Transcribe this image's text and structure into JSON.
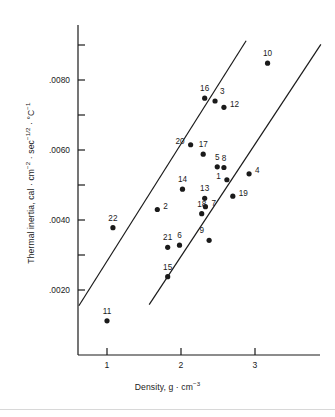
{
  "figure": {
    "kind": "scatter-plot",
    "background": "#ffffff",
    "ink_color": "#1a1a1a"
  },
  "chart_data": {
    "type": "scatter",
    "title": "",
    "xlabel": "Density, g · cm⁻³",
    "ylabel": "Thermal inertia, cal · cm⁻² · sec⁻¹ᐟ² · °C⁻¹",
    "xlabel_parts": {
      "lead": "Density, g · cm",
      "exp": "−3"
    },
    "ylabel_parts": {
      "lead": "Thermal inertia, cal · cm",
      "exp1": "−2",
      "mid1": " · sec",
      "exp2": "−1/2",
      "mid2": " · °C",
      "exp3": "−1"
    },
    "xlim": [
      0.55,
      3.48
    ],
    "ylim": [
      0.0009,
      0.00935
    ],
    "xticks": [
      1,
      2,
      3
    ],
    "xtick_labels": [
      "1",
      "2",
      "3"
    ],
    "yticks": [
      0.002,
      0.003,
      0.004,
      0.005,
      0.006,
      0.007,
      0.008,
      0.009
    ],
    "ytick_labels": [
      ".0020",
      "",
      ".0040",
      "",
      ".0060",
      "",
      ".0080",
      ""
    ],
    "ytick_labeled": [
      0.002,
      0.004,
      0.006,
      0.008
    ],
    "grid": false,
    "legend": null,
    "points": [
      {
        "label": "1",
        "x": 2.62,
        "y": 0.00515,
        "label_pos": "left"
      },
      {
        "label": "2",
        "x": 1.68,
        "y": 0.0043,
        "label_pos": "right"
      },
      {
        "label": "3",
        "x": 2.46,
        "y": 0.0074,
        "label_pos": "above-right"
      },
      {
        "label": "4",
        "x": 2.92,
        "y": 0.00532,
        "label_pos": "right"
      },
      {
        "label": "5",
        "x": 2.49,
        "y": 0.00552,
        "label_pos": "above"
      },
      {
        "label": "6",
        "x": 1.98,
        "y": 0.00328,
        "label_pos": "above"
      },
      {
        "label": "7",
        "x": 2.33,
        "y": 0.00438,
        "label_pos": "right"
      },
      {
        "label": "8",
        "x": 2.58,
        "y": 0.0055,
        "label_pos": "above"
      },
      {
        "label": "9",
        "x": 2.38,
        "y": 0.00342,
        "label_pos": "above-left"
      },
      {
        "label": "10",
        "x": 3.17,
        "y": 0.00848,
        "label_pos": "above"
      },
      {
        "label": "11",
        "x": 1.0,
        "y": 0.00112,
        "label_pos": "above"
      },
      {
        "label": "12",
        "x": 2.58,
        "y": 0.00722,
        "label_pos": "right"
      },
      {
        "label": "13",
        "x": 2.32,
        "y": 0.00462,
        "label_pos": "above"
      },
      {
        "label": "14",
        "x": 2.02,
        "y": 0.00488,
        "label_pos": "above"
      },
      {
        "label": "15",
        "x": 1.82,
        "y": 0.00238,
        "label_pos": "above"
      },
      {
        "label": "16",
        "x": 2.32,
        "y": 0.00748,
        "label_pos": "above"
      },
      {
        "label": "17",
        "x": 2.3,
        "y": 0.00588,
        "label_pos": "above"
      },
      {
        "label": "18",
        "x": 2.28,
        "y": 0.00418,
        "label_pos": "above"
      },
      {
        "label": "19",
        "x": 2.7,
        "y": 0.00468,
        "label_pos": "right"
      },
      {
        "label": "20",
        "x": 2.13,
        "y": 0.00615,
        "label_pos": "left"
      },
      {
        "label": "21",
        "x": 1.82,
        "y": 0.00322,
        "label_pos": "above"
      },
      {
        "label": "22",
        "x": 1.08,
        "y": 0.00378,
        "label_pos": "above"
      }
    ],
    "lines": [
      {
        "name": "upper-bound-line",
        "x1": 0.62,
        "y1": 0.00155,
        "x2": 2.88,
        "y2": 0.00912
      },
      {
        "name": "lower-bound-line",
        "x1": 1.57,
        "y1": 0.00158,
        "x2": 3.89,
        "y2": 0.00902
      }
    ]
  }
}
